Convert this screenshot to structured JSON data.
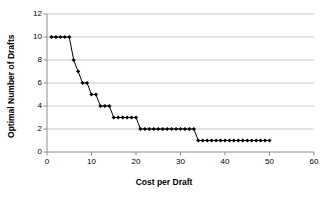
{
  "chart_data": {
    "type": "line",
    "title": "",
    "xlabel": "Cost per Draft",
    "ylabel": "Optimal Number of Drafts",
    "xlim": [
      0,
      60
    ],
    "ylim": [
      0,
      12
    ],
    "xticks": [
      0,
      10,
      20,
      30,
      40,
      50,
      60
    ],
    "yticks": [
      0,
      2,
      4,
      6,
      8,
      10,
      12
    ],
    "xtick_labels": [
      "0",
      "10",
      "20",
      "30",
      "40",
      "50",
      "60"
    ],
    "ytick_labels": [
      "0",
      "2",
      "4",
      "6",
      "8",
      "10",
      "12"
    ],
    "grid": "horizontal",
    "legend": "none",
    "marker": "diamond",
    "marker_color": "#000000",
    "line_color": "#000000",
    "series": [
      {
        "name": "Optimal Number of Drafts",
        "x": [
          1,
          2,
          3,
          4,
          5,
          6,
          7,
          8,
          9,
          10,
          11,
          12,
          13,
          14,
          15,
          16,
          17,
          18,
          19,
          20,
          21,
          22,
          23,
          24,
          25,
          26,
          27,
          28,
          29,
          30,
          31,
          32,
          33,
          34,
          35,
          36,
          37,
          38,
          39,
          40,
          41,
          42,
          43,
          44,
          45,
          46,
          47,
          48,
          49,
          50
        ],
        "y": [
          10,
          10,
          10,
          10,
          10,
          8,
          7,
          6,
          6,
          5,
          5,
          4,
          4,
          4,
          3,
          3,
          3,
          3,
          3,
          3,
          2,
          2,
          2,
          2,
          2,
          2,
          2,
          2,
          2,
          2,
          2,
          2,
          2,
          1,
          1,
          1,
          1,
          1,
          1,
          1,
          1,
          1,
          1,
          1,
          1,
          1,
          1,
          1,
          1,
          1
        ]
      }
    ]
  },
  "axes": {
    "x_title": "Cost per Draft",
    "y_title": "Optimal Number of Drafts"
  },
  "colors": {
    "grid": "#c8c8c8",
    "axis": "#8c8c8c",
    "series": "#000000",
    "background": "#ffffff"
  }
}
